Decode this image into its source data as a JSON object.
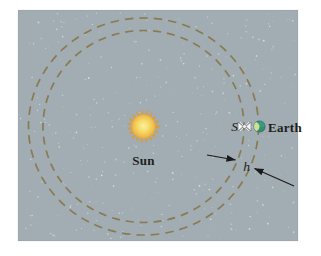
{
  "figure": {
    "labels": {
      "sun": "Sun",
      "earth": "Earth",
      "satellite": "S",
      "orbit_gap": "h"
    },
    "colors": {
      "page_background": "#ffffff",
      "panel_background": "#a2adb3",
      "star_speckle": "#dde6ea",
      "orbit_dash": "#8a7a52",
      "sun_core": "#fdf0a0",
      "sun_mid": "#f6d968",
      "sun_edge": "#ecba49",
      "sun_rays": "#dc9b39",
      "earth_ocean": "#2f7fae",
      "earth_land": "#3d9b72",
      "earth_lit_crescent": "#cfe18e",
      "satellite_body": "#f4f4f4",
      "annotation": "#1a1a1a"
    }
  }
}
